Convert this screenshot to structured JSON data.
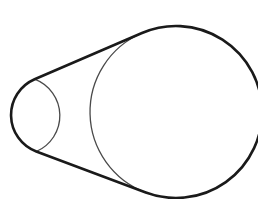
{
  "diagram": {
    "type": "belt-and-pulleys",
    "colors": {
      "background": "#ffffff",
      "belt_stroke": "#1a1a1a",
      "circle_stroke": "#4a4a4a"
    },
    "stroke_widths": {
      "belt": 2.6,
      "circle": 1.3
    },
    "small_circle": {
      "cx": 50,
      "cy": 115,
      "r": 39
    },
    "large_circle": {
      "cx": 176,
      "cy": 112,
      "r": 86
    },
    "tangent_points": {
      "upper_small": [
        34.6,
        79.2
      ],
      "upper_large": [
        142.0,
        33.0
      ],
      "lower_small": [
        36.3,
        151.5
      ],
      "lower_large": [
        145.8,
        192.5
      ]
    },
    "paths": {
      "belt": "M 142.0 33.0 A 86 86 0 1 1 145.8 192.5 L 36.3 151.5 A 39 39 0 0 1 34.6 79.2 Z",
      "small_inner_arc": "M 34.6 79.2 A 39 39 0 0 1 36.3 151.5",
      "large_inner_arc": "M 142.0 33.0 A 86 86 0 0 0 145.8 192.5"
    }
  }
}
